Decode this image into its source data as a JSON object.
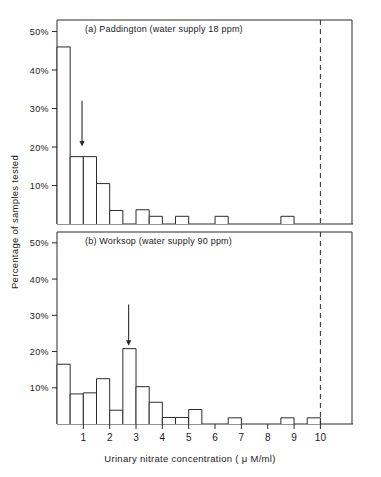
{
  "figure": {
    "ylabel": "Percentage of samples tested",
    "xlabel": "Urinary nitrate concentration ( μ M/ml)",
    "panel_a_title": "(a)  Paddington (water supply 18 ppm)",
    "panel_b_title": "(b)  Worksop (water supply 90 ppm)",
    "line_color": "#2b2b2b",
    "bar_fill": "#ffffff",
    "background": "#ffffff"
  },
  "yticks": [
    "10%",
    "20%",
    "30%",
    "40%",
    "50%"
  ],
  "xticks": [
    "1",
    "2",
    "3",
    "4",
    "5",
    "6",
    "7",
    "8",
    "9",
    "10"
  ],
  "chart_data": [
    {
      "type": "bar",
      "title": "(a)  Paddington (water supply 18 ppm)",
      "xlabel": "Urinary nitrate concentration ( μ M/ml)",
      "ylabel": "Percentage of samples tested",
      "bin_width": 0.5,
      "bin_starts": [
        0.0,
        0.5,
        1.0,
        1.5,
        2.0,
        2.5,
        3.0,
        3.5,
        4.0,
        4.5,
        5.0,
        5.5,
        6.0,
        6.5,
        7.0,
        7.5,
        8.0,
        8.5,
        9.0,
        9.5
      ],
      "values": [
        46.0,
        17.5,
        17.5,
        10.5,
        3.5,
        0,
        3.7,
        2.0,
        0,
        2.0,
        0,
        0,
        2.0,
        0,
        0,
        0,
        0,
        2.0,
        0,
        0
      ],
      "xlim": [
        0,
        11.2
      ],
      "ylim": [
        0,
        53
      ],
      "yticks": [
        10,
        20,
        30,
        40,
        50
      ],
      "ytick_labels": [
        "10%",
        "20%",
        "30%",
        "40%",
        "50%"
      ],
      "xticks": [
        1,
        2,
        3,
        4,
        5,
        6,
        7,
        8,
        9,
        10
      ],
      "grid": false,
      "legend": "none",
      "annotations": [
        {
          "kind": "arrow",
          "x": 0.95,
          "y_from": 32.0,
          "y_to": 20.5,
          "note": "mean marker"
        },
        {
          "kind": "vline",
          "x": 10.0,
          "style": "dashed"
        }
      ]
    },
    {
      "type": "bar",
      "title": "(b)  Worksop (water supply 90 ppm)",
      "xlabel": "Urinary nitrate concentration ( μ M/ml)",
      "ylabel": "Percentage of samples tested",
      "bin_width": 0.5,
      "bin_starts": [
        0.0,
        0.5,
        1.0,
        1.5,
        2.0,
        2.5,
        3.0,
        3.5,
        4.0,
        4.5,
        5.0,
        5.5,
        6.0,
        6.5,
        7.0,
        7.5,
        8.0,
        8.5,
        9.0,
        9.5
      ],
      "values": [
        16.5,
        8.3,
        8.6,
        12.5,
        3.8,
        20.8,
        10.3,
        6.0,
        1.8,
        1.8,
        4.0,
        0,
        0,
        1.7,
        0,
        0,
        0,
        1.7,
        0,
        1.7
      ],
      "xlim": [
        0,
        11.2
      ],
      "ylim": [
        0,
        53
      ],
      "yticks": [
        10,
        20,
        30,
        40,
        50
      ],
      "ytick_labels": [
        "10%",
        "20%",
        "30%",
        "40%",
        "50%"
      ],
      "xticks": [
        1,
        2,
        3,
        4,
        5,
        6,
        7,
        8,
        9,
        10
      ],
      "grid": false,
      "legend": "none",
      "annotations": [
        {
          "kind": "arrow",
          "x": 2.72,
          "y_from": 33.0,
          "y_to": 22.0,
          "note": "mean marker"
        },
        {
          "kind": "vline",
          "x": 10.0,
          "style": "dashed"
        }
      ]
    }
  ]
}
